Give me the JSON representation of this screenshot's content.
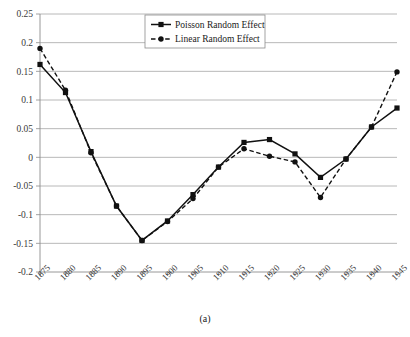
{
  "figure": {
    "caption": "(a)"
  },
  "legend": {
    "position": "top-center",
    "entries": [
      {
        "label": "Poisson Random Effect",
        "marker": "square",
        "line": "solid"
      },
      {
        "label": "Linear Random Effect",
        "marker": "circle",
        "line": "dashed"
      }
    ]
  },
  "axes": {
    "y_ticks": [
      "0.25",
      "0.2",
      "0.15",
      "0.1",
      "0.05",
      "0",
      "-0.05",
      "-0.1",
      "-0.15",
      "-0.2"
    ],
    "x_ticks": [
      "1875",
      "1880",
      "1885",
      "1890",
      "1895",
      "1900",
      "1905",
      "1910",
      "1915",
      "1920",
      "1925",
      "1930",
      "1935",
      "1940",
      "1945"
    ]
  },
  "chart_data": {
    "type": "line",
    "title": "",
    "subtitle": "",
    "xlabel": "",
    "ylabel": "",
    "caption": "(a)",
    "grid": true,
    "legend_position": "top-center",
    "categories": [
      "1875",
      "1880",
      "1885",
      "1890",
      "1895",
      "1900",
      "1905",
      "1910",
      "1915",
      "1920",
      "1925",
      "1930",
      "1935",
      "1940",
      "1945"
    ],
    "x": [
      1875,
      1880,
      1885,
      1890,
      1895,
      1900,
      1905,
      1910,
      1915,
      1920,
      1925,
      1930,
      1935,
      1940,
      1945
    ],
    "xlim": [
      1875,
      1945
    ],
    "ylim": [
      -0.2,
      0.25
    ],
    "ytick_step": 0.05,
    "series": [
      {
        "name": "Poisson Random Effect",
        "marker": "square",
        "linestyle": "solid",
        "color": "#111111",
        "values": [
          0.162,
          0.113,
          0.01,
          -0.085,
          -0.145,
          -0.111,
          -0.065,
          -0.017,
          0.026,
          0.031,
          0.006,
          -0.035,
          -0.003,
          0.053,
          0.086
        ]
      },
      {
        "name": "Linear Random Effect",
        "marker": "circle",
        "linestyle": "dashed",
        "color": "#111111",
        "values": [
          0.19,
          0.117,
          0.008,
          -0.085,
          -0.145,
          -0.112,
          -0.072,
          -0.017,
          0.015,
          0.002,
          -0.008,
          -0.07,
          -0.003,
          0.053,
          0.149
        ]
      }
    ]
  }
}
